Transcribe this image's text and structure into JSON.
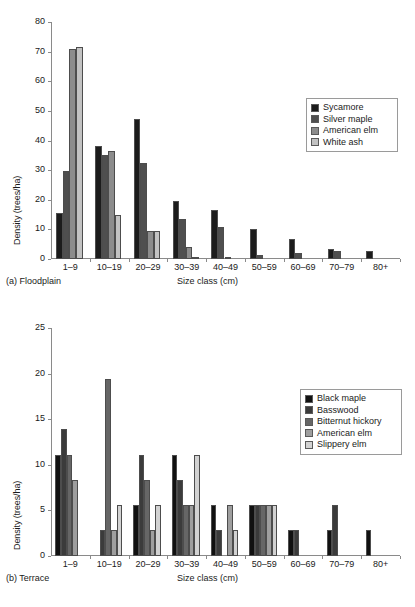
{
  "chart_data": [
    {
      "type": "bar",
      "panel": "a",
      "caption": "(a) Floodplain",
      "title": "",
      "xlabel": "Size class (cm)",
      "ylabel": "Density (trees/ha)",
      "categories": [
        "1–9",
        "10–19",
        "20–29",
        "30–39",
        "40–49",
        "50–59",
        "60–69",
        "70–79",
        "80+"
      ],
      "ylim": [
        0,
        80
      ],
      "yticks": [
        0,
        10,
        20,
        30,
        40,
        50,
        60,
        70,
        80
      ],
      "grid": false,
      "legend_position": "upper right",
      "series": [
        {
          "name": "Sycamore",
          "color": "#1c1c1c",
          "values": [
            15.5,
            38.0,
            47.3,
            19.6,
            16.4,
            10.2,
            6.7,
            3.3,
            2.6
          ]
        },
        {
          "name": "Silver maple",
          "color": "#4f4f4f",
          "values": [
            29.7,
            35.0,
            32.4,
            13.4,
            10.8,
            1.5,
            2.0,
            2.6,
            0.0
          ]
        },
        {
          "name": "American elm",
          "color": "#8c8c8c",
          "values": [
            71.0,
            36.5,
            9.4,
            4.1,
            0.7,
            0.0,
            0.0,
            0.0,
            0.0
          ]
        },
        {
          "name": "White ash",
          "color": "#c2c2c2",
          "values": [
            71.6,
            15.0,
            9.4,
            0.8,
            0.0,
            0.0,
            0.0,
            0.0,
            0.0
          ]
        }
      ]
    },
    {
      "type": "bar",
      "panel": "b",
      "caption": "(b) Terrace",
      "title": "",
      "xlabel": "Size class (cm)",
      "ylabel": "Density (trees/ha)",
      "categories": [
        "1–9",
        "10–19",
        "20–29",
        "30–39",
        "40–49",
        "50–59",
        "60–69",
        "70–79",
        "80+"
      ],
      "ylim": [
        0,
        25
      ],
      "yticks": [
        0,
        5,
        10,
        15,
        20,
        25
      ],
      "grid": false,
      "legend_position": "center right",
      "series": [
        {
          "name": "Black maple",
          "color": "#111111",
          "values": [
            11.1,
            0.0,
            5.6,
            11.1,
            5.6,
            5.6,
            2.8,
            2.8,
            2.8
          ]
        },
        {
          "name": "Basswood",
          "color": "#3b3b3b",
          "values": [
            13.9,
            2.8,
            11.1,
            8.3,
            2.8,
            5.6,
            2.8,
            5.6,
            0.0
          ]
        },
        {
          "name": "Bitternut hickory",
          "color": "#666666",
          "values": [
            11.1,
            19.4,
            8.3,
            5.6,
            0.0,
            5.6,
            0.0,
            0.0,
            0.0
          ]
        },
        {
          "name": "American elm",
          "color": "#9e9e9e",
          "values": [
            8.3,
            2.8,
            2.8,
            5.6,
            5.6,
            5.6,
            0.0,
            0.0,
            0.0
          ]
        },
        {
          "name": "Slippery elm",
          "color": "#d2d2d2",
          "values": [
            0.0,
            5.6,
            5.6,
            11.1,
            2.8,
            5.6,
            0.0,
            0.0,
            0.0
          ]
        }
      ]
    }
  ]
}
